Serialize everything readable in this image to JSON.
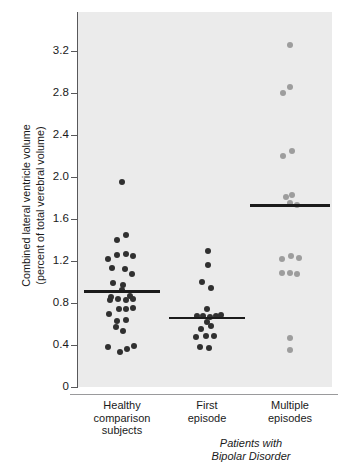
{
  "chart_data": {
    "type": "scatter",
    "title": "",
    "subtitle": "",
    "xlabel": "Patients with Bipolar Disorder",
    "ylabel": "Combined lateral ventricle volume (percent of total verebral volume)",
    "ylabel_line1": "Combined lateral ventricle volume",
    "ylabel_line2": "(percent of total verebral volume)",
    "ylim": [
      0,
      3.4
    ],
    "yticks": [
      0,
      0.4,
      0.8,
      1.2,
      1.6,
      2.0,
      2.4,
      2.8,
      3.2
    ],
    "ytick_labels": [
      "0",
      "0.4",
      "0.8",
      "1.2",
      "1.6",
      "2.0",
      "2.4",
      "2.8",
      "3.2"
    ],
    "grid": false,
    "legend": "none",
    "panel_background": "#ebebeb",
    "categories": [
      "Healthy comparison subjects",
      "First episode",
      "Multiple episodes"
    ],
    "category_label_lines": [
      [
        "Healthy",
        "comparison",
        "subjects"
      ],
      [
        "First",
        "episode"
      ],
      [
        "Multiple",
        "episodes"
      ]
    ],
    "group_bracket_label_lines": [
      "Patients with",
      "Bipolar Disorder"
    ],
    "series": [
      {
        "name": "Healthy comparison subjects",
        "color": "#303030",
        "mean": 0.91,
        "n": 31,
        "points": [
          {
            "jitter": 0.0,
            "value": 1.95
          },
          {
            "jitter": -0.22,
            "value": 1.4
          },
          {
            "jitter": 0.18,
            "value": 1.45
          },
          {
            "jitter": -0.22,
            "value": 1.26
          },
          {
            "jitter": 0.18,
            "value": 1.27
          },
          {
            "jitter": 0.52,
            "value": 1.25
          },
          {
            "jitter": -0.62,
            "value": 1.22
          },
          {
            "jitter": -0.45,
            "value": 1.13
          },
          {
            "jitter": 0.12,
            "value": 1.12
          },
          {
            "jitter": 0.44,
            "value": 1.08
          },
          {
            "jitter": -0.4,
            "value": 0.99
          },
          {
            "jitter": 0.06,
            "value": 0.97
          },
          {
            "jitter": -0.5,
            "value": 0.86
          },
          {
            "jitter": 0.0,
            "value": 0.92
          },
          {
            "jitter": 0.38,
            "value": 0.87
          },
          {
            "jitter": -0.56,
            "value": 0.83
          },
          {
            "jitter": -0.18,
            "value": 0.84
          },
          {
            "jitter": 0.2,
            "value": 0.83
          },
          {
            "jitter": 0.52,
            "value": 0.84
          },
          {
            "jitter": -0.58,
            "value": 0.7
          },
          {
            "jitter": -0.14,
            "value": 0.74
          },
          {
            "jitter": 0.2,
            "value": 0.74
          },
          {
            "jitter": 0.5,
            "value": 0.75
          },
          {
            "jitter": -0.22,
            "value": 0.63
          },
          {
            "jitter": 0.18,
            "value": 0.64
          },
          {
            "jitter": -0.28,
            "value": 0.57
          },
          {
            "jitter": 0.06,
            "value": 0.53
          },
          {
            "jitter": -0.64,
            "value": 0.38
          },
          {
            "jitter": -0.1,
            "value": 0.33
          },
          {
            "jitter": 0.22,
            "value": 0.36
          },
          {
            "jitter": 0.54,
            "value": 0.39
          }
        ]
      },
      {
        "name": "First episode",
        "color": "#303030",
        "mean": 0.66,
        "n": 18,
        "points": [
          {
            "jitter": 0.06,
            "value": 1.3
          },
          {
            "jitter": 0.06,
            "value": 1.16
          },
          {
            "jitter": -0.22,
            "value": 1.0
          },
          {
            "jitter": 0.2,
            "value": 0.94
          },
          {
            "jitter": 0.0,
            "value": 0.74
          },
          {
            "jitter": -0.44,
            "value": 0.68
          },
          {
            "jitter": -0.2,
            "value": 0.68
          },
          {
            "jitter": 0.14,
            "value": 0.67
          },
          {
            "jitter": 0.4,
            "value": 0.68
          },
          {
            "jitter": 0.62,
            "value": 0.69
          },
          {
            "jitter": 0.0,
            "value": 0.62
          },
          {
            "jitter": -0.26,
            "value": 0.55
          },
          {
            "jitter": 0.2,
            "value": 0.58
          },
          {
            "jitter": -0.52,
            "value": 0.48
          },
          {
            "jitter": -0.06,
            "value": 0.49
          },
          {
            "jitter": 0.32,
            "value": 0.49
          },
          {
            "jitter": -0.3,
            "value": 0.38
          },
          {
            "jitter": 0.1,
            "value": 0.37
          }
        ]
      },
      {
        "name": "Multiple episodes",
        "color": "#9d9d9d",
        "mean": 1.73,
        "n": 16,
        "points": [
          {
            "jitter": 0.0,
            "value": 3.26
          },
          {
            "jitter": -0.02,
            "value": 2.86
          },
          {
            "jitter": -0.34,
            "value": 2.8
          },
          {
            "jitter": 0.08,
            "value": 2.25
          },
          {
            "jitter": -0.32,
            "value": 2.2
          },
          {
            "jitter": -0.18,
            "value": 1.81
          },
          {
            "jitter": 0.1,
            "value": 1.83
          },
          {
            "jitter": 0.02,
            "value": 1.75
          },
          {
            "jitter": 0.3,
            "value": 1.73
          },
          {
            "jitter": -0.36,
            "value": 1.22
          },
          {
            "jitter": 0.06,
            "value": 1.25
          },
          {
            "jitter": 0.42,
            "value": 1.23
          },
          {
            "jitter": -0.36,
            "value": 1.09
          },
          {
            "jitter": 0.02,
            "value": 1.09
          },
          {
            "jitter": 0.32,
            "value": 1.08
          },
          {
            "jitter": 0.02,
            "value": 0.47
          },
          {
            "jitter": 0.02,
            "value": 0.35
          }
        ]
      }
    ]
  }
}
